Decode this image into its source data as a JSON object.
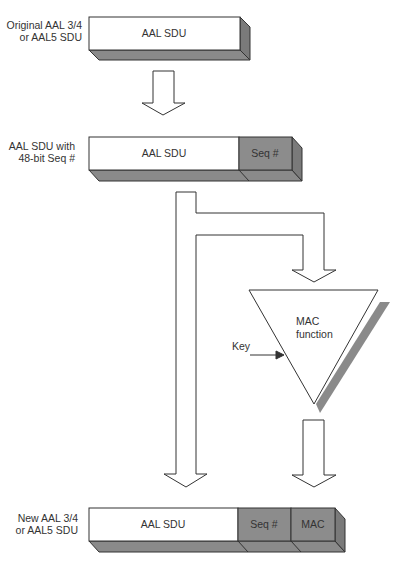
{
  "stages": {
    "original": {
      "caption_line1": "Original AAL 3/4",
      "caption_line2": "or AAL5 SDU",
      "box_label": "AAL SDU"
    },
    "with_seq": {
      "caption_line1": "AAL SDU with",
      "caption_line2": "48-bit Seq #",
      "box_label": "AAL SDU",
      "seq_label": "Seq #"
    },
    "mac": {
      "label_line1": "MAC",
      "label_line2": "function",
      "key_label": "Key"
    },
    "new": {
      "caption_line1": "New AAL 3/4",
      "caption_line2": "or AAL5 SDU",
      "box_label": "AAL SDU",
      "seq_label": "Seq #",
      "mac_label": "MAC"
    }
  },
  "colors": {
    "stroke": "#333333",
    "white_face": "#ffffff",
    "gray_face": "#8c8c8c",
    "gray_depth": "#7a7a7a",
    "shadow": "#8a8a8a"
  }
}
